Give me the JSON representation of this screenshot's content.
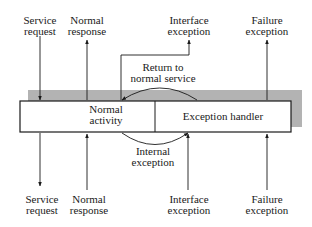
{
  "diagram": {
    "type": "fault-tolerant component model",
    "colors": {
      "stroke": "#1a1a1a",
      "shadow": "#b3b3b3",
      "box_fill": "#ffffff",
      "background": "#ffffff"
    },
    "component": {
      "left_section": {
        "line1": "Normal",
        "line2": "activity"
      },
      "right_section": {
        "line1": "Exception handler"
      }
    },
    "top_labels": [
      {
        "id": "service-request",
        "line1": "Service",
        "line2": "request",
        "direction": "into-component"
      },
      {
        "id": "normal-response",
        "line1": "Normal",
        "line2": "response",
        "direction": "out-of-component"
      },
      {
        "id": "interface-exception",
        "line1": "Interface",
        "line2": "exception",
        "direction": "out-of-component"
      },
      {
        "id": "failure-exception",
        "line1": "Failure",
        "line2": "exception",
        "direction": "out-of-component"
      }
    ],
    "bottom_labels": [
      {
        "id": "service-request",
        "line1": "Service",
        "line2": "request",
        "direction": "out-of-component"
      },
      {
        "id": "normal-response",
        "line1": "Normal",
        "line2": "response",
        "direction": "into-component"
      },
      {
        "id": "interface-exception",
        "line1": "Interface",
        "line2": "exception",
        "direction": "into-component"
      },
      {
        "id": "failure-exception",
        "line1": "Failure",
        "line2": "exception",
        "direction": "into-component"
      }
    ],
    "internal_transitions": [
      {
        "id": "return-to-normal",
        "line1": "Return to",
        "line2": "normal service",
        "from": "Exception handler",
        "to": "Normal activity"
      },
      {
        "id": "internal-exception",
        "line1": "Internal",
        "line2": "exception",
        "from": "Normal activity",
        "to": "Exception handler"
      }
    ]
  }
}
